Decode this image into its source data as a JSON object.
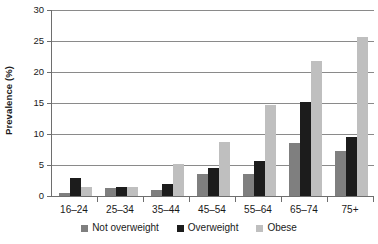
{
  "chart_data": {
    "type": "bar",
    "title": "",
    "subtitle": "",
    "xlabel": "",
    "ylabel": "Prevalence (%)",
    "ylim": [
      0,
      30
    ],
    "yticks": [
      0,
      5,
      10,
      15,
      20,
      25,
      30
    ],
    "ytick_labels": [
      "0",
      "5",
      "10",
      "15",
      "20",
      "25",
      "30"
    ],
    "grid": "horizontal",
    "legend_position": "bottom-center",
    "categories": [
      "16–24",
      "25–34",
      "35–44",
      "45–54",
      "55–64",
      "65–74",
      "75+"
    ],
    "series": [
      {
        "name": "Not overweight",
        "color": "#7f7f7f",
        "values": [
          0.5,
          1.3,
          1.0,
          3.5,
          3.6,
          8.5,
          7.2
        ]
      },
      {
        "name": "Overweight",
        "color": "#1c1c1c",
        "values": [
          2.9,
          1.4,
          2.0,
          4.5,
          5.7,
          15.2,
          9.5
        ]
      },
      {
        "name": "Obese",
        "color": "#bfbfbf",
        "values": [
          1.5,
          1.4,
          5.2,
          8.7,
          14.7,
          21.7,
          25.6
        ]
      }
    ]
  }
}
